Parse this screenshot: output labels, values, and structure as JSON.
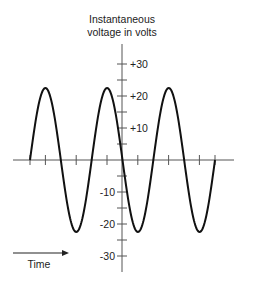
{
  "chart_data": {
    "type": "line",
    "title": "Instantaneous voltage in volts",
    "title_lines": [
      "Instantaneous",
      "voltage in volts"
    ],
    "xlabel": "Time",
    "ylabel": "Instantaneous voltage in volts",
    "ylim": [
      -30,
      30
    ],
    "yticks": [
      -30,
      -20,
      -10,
      10,
      20,
      30
    ],
    "ytick_labels": [
      "-30",
      "-20",
      "-10",
      "+10",
      "+20",
      "+30"
    ],
    "minor_yticks": [
      -25,
      -15,
      -5,
      5,
      15,
      25
    ],
    "grid": false,
    "legend": null,
    "series": [
      {
        "name": "sine voltage",
        "waveform": "sine",
        "amplitude": 22.5,
        "cycles": 3,
        "x": [
          0,
          0.25,
          0.5,
          0.75,
          1.0,
          1.25,
          1.5,
          1.75,
          2.0,
          2.25,
          2.5,
          2.75,
          3.0
        ],
        "values": [
          0,
          22.5,
          0,
          -22.5,
          0,
          22.5,
          0,
          -22.5,
          0,
          22.5,
          0,
          -22.5,
          0
        ]
      }
    ],
    "annotations": [
      "Time arrow pointing right"
    ],
    "colors": {
      "line": "#111111",
      "axis": "#555555",
      "text": "#222222"
    }
  },
  "labels": {
    "title_line1": "Instantaneous",
    "title_line2": "voltage in volts",
    "time": "Time",
    "y_p30": "+30",
    "y_p20": "+20",
    "y_p10": "+10",
    "y_m10": "-10",
    "y_m20": "-20",
    "y_m30": "-30"
  }
}
